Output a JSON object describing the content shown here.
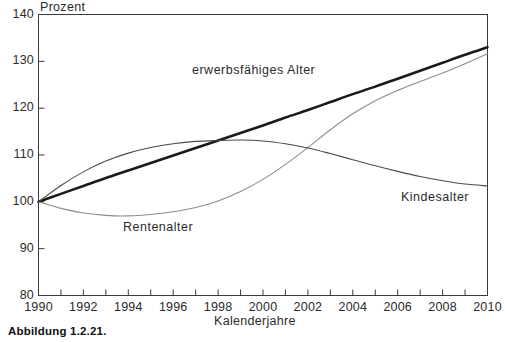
{
  "figure": {
    "caption": "Abbildung 1.2.21."
  },
  "chart_data": {
    "type": "line",
    "title": "",
    "xlabel": "Kalenderjahre",
    "ylabel": "Prozent",
    "xlim": [
      1990,
      2010
    ],
    "ylim": [
      80,
      140
    ],
    "grid": false,
    "legend_position": "inline-annotations",
    "x_tick_values": [
      1990,
      1991,
      1992,
      1993,
      1994,
      1995,
      1996,
      1997,
      1998,
      1999,
      2000,
      2001,
      2002,
      2003,
      2004,
      2005,
      2006,
      2007,
      2008,
      2009,
      2010
    ],
    "x_tick_labels": [
      "1990",
      "1992",
      "1994",
      "1996",
      "1998",
      "2000",
      "2002",
      "2004",
      "2006",
      "2008",
      "2010"
    ],
    "x_labelled_values": [
      1990,
      1992,
      1994,
      1996,
      1998,
      2000,
      2002,
      2004,
      2006,
      2008,
      2010
    ],
    "y_tick_labels": [
      "140",
      "130",
      "120",
      "110",
      "100",
      "90",
      "80"
    ],
    "y_tick_values": [
      140,
      130,
      120,
      110,
      100,
      90,
      80
    ],
    "x": [
      1990,
      1991,
      1992,
      1993,
      1994,
      1995,
      1996,
      1997,
      1998,
      1999,
      2000,
      2001,
      2002,
      2003,
      2004,
      2005,
      2006,
      2007,
      2008,
      2009,
      2010
    ],
    "series": [
      {
        "name": "erwerbsfähiges Alter",
        "color": "#1a1a1a",
        "width": 2.6,
        "values": [
          100.0,
          101.7,
          103.4,
          105.1,
          106.7,
          108.3,
          109.9,
          111.5,
          113.1,
          114.7,
          116.3,
          118.0,
          119.6,
          121.3,
          123.0,
          124.6,
          126.3,
          128.0,
          129.7,
          131.4,
          133.0
        ]
      },
      {
        "name": "Rentenalter",
        "color": "#8c8c8c",
        "width": 1.1,
        "values": [
          100.0,
          98.6,
          97.6,
          97.1,
          97.0,
          97.3,
          97.9,
          98.8,
          100.2,
          102.2,
          104.8,
          108.0,
          111.6,
          115.4,
          118.8,
          121.6,
          123.8,
          125.7,
          127.5,
          129.5,
          131.6
        ]
      },
      {
        "name": "Kindesalter",
        "color": "#4a4a4a",
        "width": 1.1,
        "values": [
          100.0,
          103.5,
          106.4,
          108.7,
          110.4,
          111.6,
          112.4,
          112.9,
          113.1,
          113.2,
          113.0,
          112.4,
          111.5,
          110.3,
          109.0,
          107.7,
          106.5,
          105.4,
          104.5,
          103.8,
          103.4
        ]
      }
    ]
  }
}
